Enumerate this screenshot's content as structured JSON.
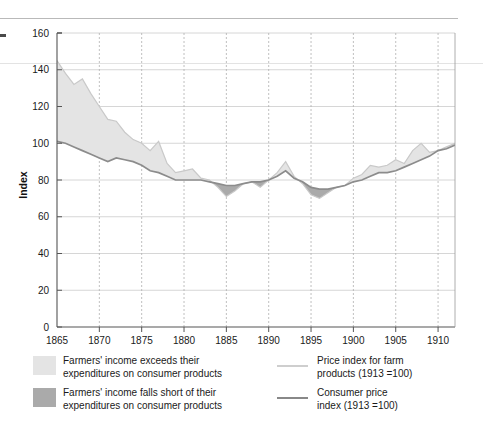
{
  "chart_data": {
    "type": "area",
    "title": "",
    "xlabel": "",
    "ylabel": "Index",
    "xlim": [
      1865,
      1912
    ],
    "ylim": [
      0,
      160
    ],
    "ytick_labels": [
      "0",
      "20",
      "40",
      "60",
      "80",
      "100",
      "120",
      "140",
      "160"
    ],
    "yticks": [
      0,
      20,
      40,
      60,
      80,
      100,
      120,
      140,
      160
    ],
    "xtick_labels": [
      "1865",
      "1870",
      "1875",
      "1880",
      "1885",
      "1890",
      "1895",
      "1900",
      "1905",
      "1910"
    ],
    "xticks": [
      1865,
      1870,
      1875,
      1880,
      1885,
      1890,
      1895,
      1900,
      1905,
      1910
    ],
    "grid": true,
    "legend_position": "below",
    "x": [
      1865,
      1866,
      1867,
      1868,
      1869,
      1870,
      1871,
      1872,
      1873,
      1874,
      1875,
      1876,
      1877,
      1878,
      1879,
      1880,
      1881,
      1882,
      1883,
      1884,
      1885,
      1886,
      1887,
      1888,
      1889,
      1890,
      1891,
      1892,
      1893,
      1894,
      1895,
      1896,
      1897,
      1898,
      1899,
      1900,
      1901,
      1902,
      1903,
      1904,
      1905,
      1906,
      1907,
      1908,
      1909,
      1910,
      1911,
      1912
    ],
    "series": [
      {
        "name": "Price index for farm products (1913 =100)",
        "color": "#c9c9c9",
        "values": [
          145,
          138,
          132,
          135,
          127,
          120,
          113,
          112,
          106,
          102,
          100,
          96,
          101,
          89,
          84,
          85,
          86,
          81,
          80,
          76,
          71,
          74,
          78,
          79,
          76,
          80,
          84,
          90,
          82,
          78,
          72,
          70,
          73,
          76,
          77,
          81,
          83,
          88,
          87,
          88,
          91,
          89,
          96,
          100,
          95,
          96,
          98,
          100
        ],
        "ylim": [
          0,
          160
        ]
      },
      {
        "name": "Consumer price index (1913 =100)",
        "color": "#8c8c8c",
        "values": [
          101,
          100,
          98,
          96,
          94,
          92,
          90,
          92,
          91,
          90,
          88,
          85,
          84,
          82,
          80,
          80,
          80,
          80,
          79,
          78,
          77,
          77,
          78,
          79,
          79,
          80,
          82,
          85,
          81,
          79,
          76,
          75,
          75,
          76,
          77,
          79,
          80,
          82,
          84,
          84,
          85,
          87,
          89,
          91,
          93,
          96,
          97,
          99
        ],
        "ylim": [
          0,
          160
        ]
      }
    ]
  },
  "legend": {
    "items": [
      {
        "kind": "swatch",
        "color": "#e4e4e4",
        "line1": "Farmers' income exceeds their",
        "line2": "expenditures on consumer products"
      },
      {
        "kind": "swatch",
        "color": "#aaaaaa",
        "line1": "Farmers' income falls short of their",
        "line2": "expenditures on consumer products"
      },
      {
        "kind": "line",
        "color": "#c2c2c2",
        "line1": "Price index for farm",
        "line2": "products (1913 =100)"
      },
      {
        "kind": "line",
        "color": "#7b7b7b",
        "line1": "Consumer price",
        "line2": "index (1913 =100)"
      }
    ]
  },
  "colors": {
    "fill_above": "#e4e4e4",
    "fill_below": "#aaaaaa",
    "farm_line": "#c2c2c2",
    "cpi_line": "#7b7b7b",
    "grid": "#cccccc",
    "axis": "#555555"
  }
}
